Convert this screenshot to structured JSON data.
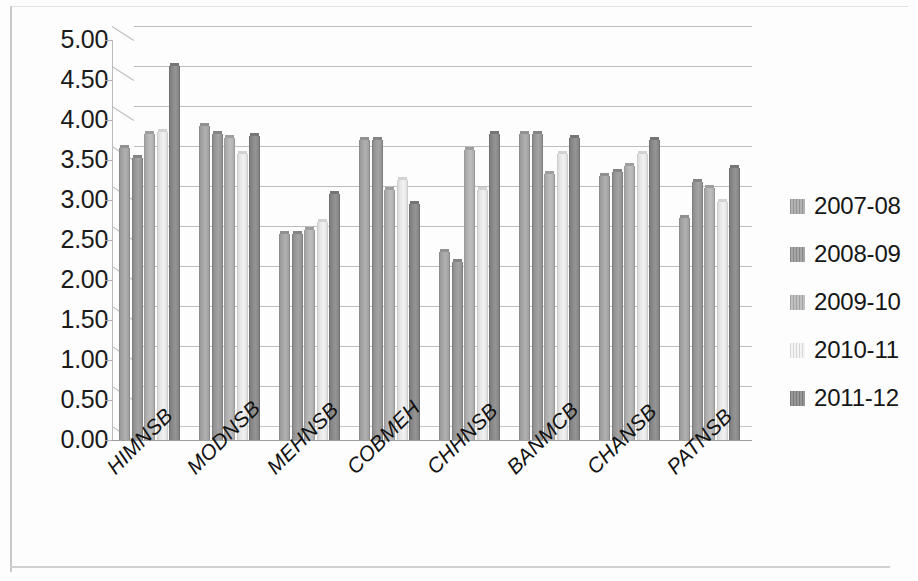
{
  "chart_data": {
    "type": "bar",
    "title": "",
    "subtitle": "",
    "xlabel": "",
    "ylabel": "",
    "ylim": [
      0.0,
      5.0
    ],
    "ytick_step": 0.5,
    "ytick_labels": [
      "5.00",
      "4.50",
      "4.00",
      "3.50",
      "3.00",
      "2.50",
      "2.00",
      "1.50",
      "1.00",
      "0.50",
      "0.00"
    ],
    "ytick_values": [
      5.0,
      4.5,
      4.0,
      3.5,
      3.0,
      2.5,
      2.0,
      1.5,
      1.0,
      0.5,
      0.0
    ],
    "grid": true,
    "grid_axis": "y",
    "legend_position": "right",
    "categories": [
      "HIMNSB",
      "MODNSB",
      "MEHNSB",
      "COBMEH",
      "CHHNSB",
      "BANMCB",
      "CHANSB",
      "PATNSB"
    ],
    "series": [
      {
        "name": "2007-08",
        "color": "#a6a6a6",
        "values": [
          3.65,
          3.92,
          2.57,
          3.75,
          2.35,
          3.82,
          3.3,
          2.78
        ]
      },
      {
        "name": "2008-09",
        "color": "#9a9a9a",
        "values": [
          3.52,
          3.82,
          2.57,
          3.75,
          2.23,
          3.82,
          3.35,
          3.22
        ]
      },
      {
        "name": "2009-10",
        "color": "#b4b4b4",
        "values": [
          3.82,
          3.78,
          2.62,
          3.12,
          3.62,
          3.32,
          3.43,
          3.15
        ]
      },
      {
        "name": "2010-11",
        "color": "#e8e8e8",
        "values": [
          3.85,
          3.58,
          2.73,
          3.25,
          3.12,
          3.58,
          3.58,
          2.98
        ]
      },
      {
        "name": "2011-12",
        "color": "#8b8b8b",
        "values": [
          4.67,
          3.8,
          3.08,
          2.95,
          3.82,
          3.78,
          3.75,
          3.4
        ]
      }
    ]
  },
  "legend": {
    "items": [
      {
        "label": "2007-08"
      },
      {
        "label": "2008-09"
      },
      {
        "label": "2009-10"
      },
      {
        "label": "2010-11"
      },
      {
        "label": "2011-12"
      }
    ]
  },
  "colors": {
    "gridline": "#bdbdbd",
    "axis": "#b0b0b0",
    "text": "#141414",
    "background": "#ffffff"
  }
}
